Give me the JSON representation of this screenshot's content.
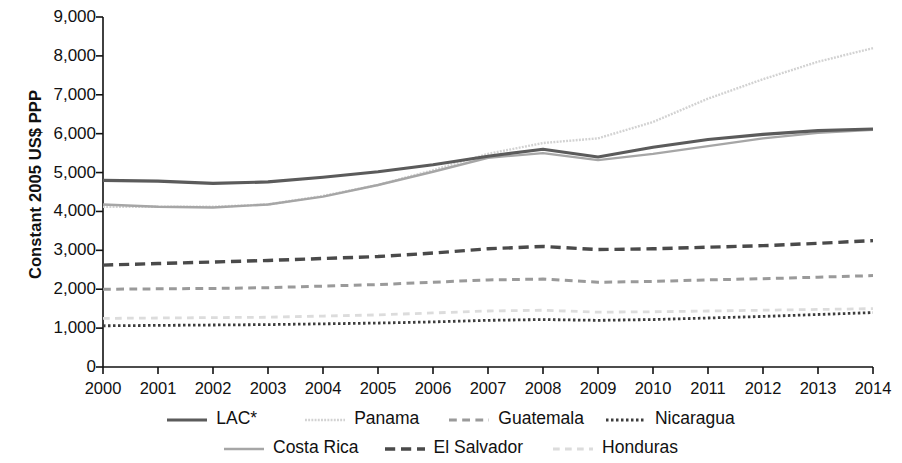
{
  "chart_data": {
    "type": "line",
    "title": "",
    "xlabel": "",
    "ylabel": "Constant 2005 US$ PPP",
    "x": [
      2000,
      2001,
      2002,
      2003,
      2004,
      2005,
      2006,
      2007,
      2008,
      2009,
      2010,
      2011,
      2012,
      2013,
      2014
    ],
    "xtick_labels": [
      "2000",
      "2001",
      "2002",
      "2003",
      "2004",
      "2005",
      "2006",
      "2007",
      "2008",
      "2009",
      "2010",
      "2011",
      "2012",
      "2013",
      "2014"
    ],
    "ytick_labels": [
      "0",
      "1,000",
      "2,000",
      "3,000",
      "4,000",
      "5,000",
      "6,000",
      "7,000",
      "8,000",
      "9,000"
    ],
    "ytick_values": [
      0,
      1000,
      2000,
      3000,
      4000,
      5000,
      6000,
      7000,
      8000,
      9000
    ],
    "xlim": [
      2000,
      2014
    ],
    "ylim": [
      0,
      9000
    ],
    "grid": false,
    "legend_position": "bottom",
    "series": [
      {
        "name": "LAC*",
        "style": "solid",
        "color": "#5b5b5b",
        "width": 3.2,
        "values": [
          4800,
          4780,
          4720,
          4760,
          4880,
          5020,
          5200,
          5420,
          5600,
          5400,
          5650,
          5850,
          5980,
          6080,
          6120
        ]
      },
      {
        "name": "Costa Rica",
        "style": "solid",
        "color": "#a6a6a6",
        "width": 2.4,
        "values": [
          4180,
          4120,
          4100,
          4180,
          4380,
          4680,
          5020,
          5380,
          5500,
          5320,
          5480,
          5680,
          5880,
          6020,
          6100
        ]
      },
      {
        "name": "Panama",
        "style": "fine-dot",
        "color": "#d2d2d2",
        "width": 2.4,
        "values": [
          4120,
          4120,
          4120,
          4180,
          4400,
          4680,
          5060,
          5480,
          5760,
          5880,
          6300,
          6900,
          7400,
          7850,
          8200
        ]
      },
      {
        "name": "El Salvador",
        "style": "dash-long",
        "color": "#4a4a4a",
        "width": 3.4,
        "values": [
          2620,
          2660,
          2700,
          2740,
          2790,
          2840,
          2930,
          3040,
          3100,
          3020,
          3040,
          3080,
          3120,
          3180,
          3250
        ]
      },
      {
        "name": "Guatemala",
        "style": "dash-med",
        "color": "#9a9a9a",
        "width": 3.0,
        "values": [
          2000,
          2010,
          2020,
          2040,
          2080,
          2120,
          2180,
          2240,
          2260,
          2180,
          2200,
          2240,
          2270,
          2310,
          2350
        ]
      },
      {
        "name": "Honduras",
        "style": "dash-light",
        "color": "#dcdcdc",
        "width": 2.8,
        "values": [
          1250,
          1260,
          1270,
          1280,
          1310,
          1340,
          1390,
          1440,
          1460,
          1410,
          1420,
          1440,
          1460,
          1480,
          1500
        ]
      },
      {
        "name": "Nicaragua",
        "style": "dot",
        "color": "#3d3d3d",
        "width": 2.8,
        "values": [
          1060,
          1070,
          1080,
          1090,
          1110,
          1130,
          1160,
          1200,
          1220,
          1200,
          1220,
          1260,
          1300,
          1350,
          1400
        ]
      }
    ]
  },
  "axis": {
    "y_label": "Constant 2005 US$ PPP"
  },
  "legend": {
    "row1": [
      {
        "label": "LAC*",
        "series": "LAC*"
      },
      {
        "label": "Panama",
        "series": "Panama"
      },
      {
        "label": "Guatemala",
        "series": "Guatemala"
      },
      {
        "label": "Nicaragua",
        "series": "Nicaragua"
      }
    ],
    "row2": [
      {
        "label": "Costa Rica",
        "series": "Costa Rica"
      },
      {
        "label": "El Salvador",
        "series": "El Salvador"
      },
      {
        "label": "Honduras",
        "series": "Honduras"
      }
    ]
  }
}
